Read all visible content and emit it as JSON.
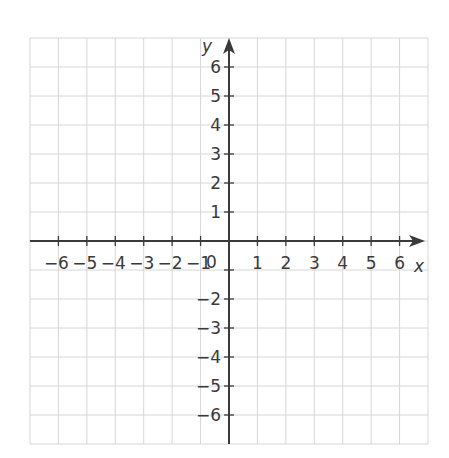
{
  "chart_data": {
    "type": "coordinate-grid",
    "title": "",
    "xlabel": "x",
    "ylabel": "y",
    "xlim": [
      -7,
      7
    ],
    "ylim": [
      -7,
      7
    ],
    "grid": true,
    "x_ticks": [
      -6,
      -5,
      -4,
      -3,
      -2,
      -1,
      1,
      2,
      3,
      4,
      5,
      6
    ],
    "y_ticks": [
      -6,
      -5,
      -4,
      -3,
      -2,
      -1,
      1,
      2,
      3,
      4,
      5,
      6
    ],
    "x_tick_labels": [
      "−6",
      "−5",
      "−4",
      "−3",
      "−2",
      "−1",
      "1",
      "2",
      "3",
      "4",
      "5",
      "6"
    ],
    "y_tick_labels_positive": [
      "6",
      "5",
      "4",
      "3",
      "2",
      "1"
    ],
    "y_tick_labels_negative": [
      "−2",
      "−3",
      "−4",
      "−5",
      "−6"
    ],
    "origin_label": "0",
    "series": [],
    "axes": {
      "x_arrow": "positive-only",
      "y_arrow": "positive-only"
    }
  },
  "colors": {
    "grid": "#d6d6d6",
    "axis": "#3a3a3a",
    "text": "#3a3a3a"
  }
}
